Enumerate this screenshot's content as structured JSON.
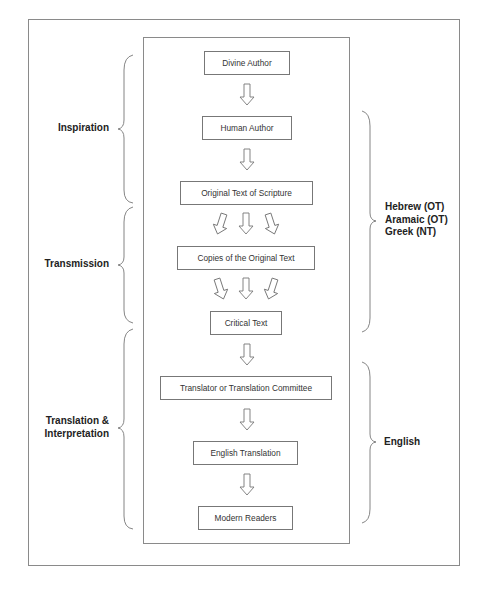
{
  "diagram": {
    "nodes": [
      {
        "id": "divine-author",
        "label": "Divine Author"
      },
      {
        "id": "human-author",
        "label": "Human Author"
      },
      {
        "id": "original-text",
        "label": "Original Text of Scripture"
      },
      {
        "id": "copies",
        "label": "Copies of the Original Text"
      },
      {
        "id": "critical-text",
        "label": "Critical Text"
      },
      {
        "id": "translator",
        "label": "Translator or Translation Committee"
      },
      {
        "id": "english-translation",
        "label": "English Translation"
      },
      {
        "id": "modern-readers",
        "label": "Modern Readers"
      }
    ],
    "left_groups": [
      {
        "label": "Inspiration",
        "spans": [
          "divine-author",
          "original-text"
        ]
      },
      {
        "label": "Transmission",
        "spans": [
          "original-text",
          "critical-text"
        ]
      },
      {
        "label_line1": "Translation &",
        "label_line2": "Interpretation",
        "spans": [
          "critical-text",
          "modern-readers"
        ]
      }
    ],
    "right_groups": [
      {
        "lines": [
          "Hebrew (OT)",
          "Aramaic (OT)",
          "Greek (NT)"
        ],
        "spans": [
          "human-author",
          "critical-text"
        ]
      },
      {
        "lines": [
          "English"
        ],
        "spans": [
          "translator",
          "modern-readers"
        ]
      }
    ],
    "edges": [
      {
        "from": "divine-author",
        "to": "human-author",
        "style": "single-arrow"
      },
      {
        "from": "human-author",
        "to": "original-text",
        "style": "single-arrow"
      },
      {
        "from": "original-text",
        "to": "copies",
        "style": "triple-arrow-diverging"
      },
      {
        "from": "copies",
        "to": "critical-text",
        "style": "triple-arrow-converging"
      },
      {
        "from": "critical-text",
        "to": "translator",
        "style": "single-arrow"
      },
      {
        "from": "translator",
        "to": "english-translation",
        "style": "single-arrow"
      },
      {
        "from": "english-translation",
        "to": "modern-readers",
        "style": "single-arrow"
      }
    ],
    "colors": {
      "line": "#777777",
      "text": "#222222",
      "background": "#ffffff"
    }
  }
}
